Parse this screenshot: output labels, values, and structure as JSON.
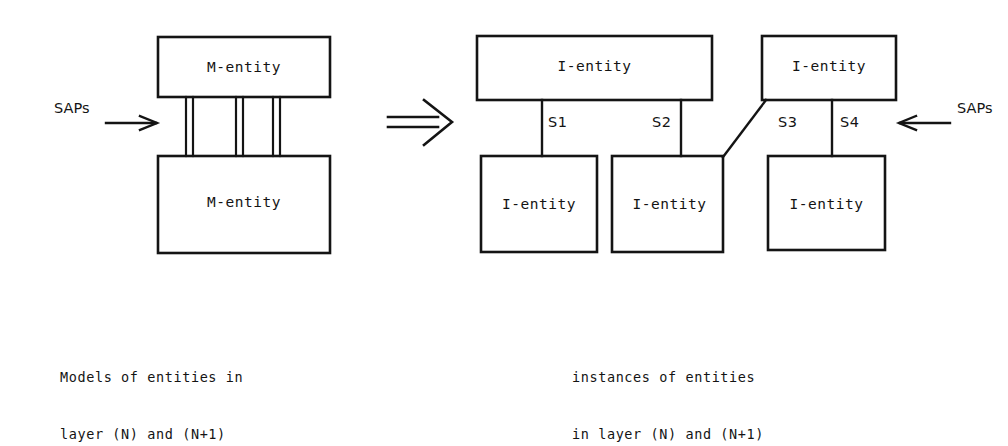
{
  "figure": {
    "stroke_color": "#141414",
    "background_color": "#ffffff"
  },
  "left_panel": {
    "sap_label": "SAPs",
    "arrow_icon": "arrow-right-icon",
    "boxes": [
      {
        "id": "m-entity-upper",
        "label": "M-entity"
      },
      {
        "id": "m-entity-lower",
        "label": "M-entity"
      }
    ],
    "connector_count": 3,
    "connector_note": "three pairs of parallel vertical lines joining the two M-entity boxes",
    "caption": {
      "line1": "Models of entities in",
      "line2": "layer (N) and (N+1)"
    }
  },
  "transform": {
    "symbol": "⇒",
    "icon": "double-arrow-right-icon"
  },
  "right_panel": {
    "sap_label": "SAPs",
    "arrow_icon": "arrow-left-icon",
    "top_boxes": [
      {
        "id": "i-entity-top-wide",
        "label": "I-entity"
      },
      {
        "id": "i-entity-top-right",
        "label": "I-entity"
      }
    ],
    "bottom_boxes": [
      {
        "id": "i-entity-bottom-1",
        "label": "I-entity"
      },
      {
        "id": "i-entity-bottom-2",
        "label": "I-entity"
      },
      {
        "id": "i-entity-bottom-3",
        "label": "I-entity"
      }
    ],
    "connections": [
      {
        "id": "s1",
        "label": "S1",
        "kind": "vertical",
        "from": "i-entity-top-wide",
        "to": "i-entity-bottom-1"
      },
      {
        "id": "s2",
        "label": "S2",
        "kind": "vertical",
        "from": "i-entity-top-wide",
        "to": "i-entity-bottom-2"
      },
      {
        "id": "s3",
        "label": "S3",
        "kind": "diagonal",
        "from": "i-entity-top-right",
        "to": "i-entity-bottom-2"
      },
      {
        "id": "s4",
        "label": "S4",
        "kind": "vertical",
        "from": "i-entity-top-right",
        "to": "i-entity-bottom-3"
      }
    ],
    "caption": {
      "line1": "instances of entities",
      "line2": "in layer (N) and (N+1)"
    }
  }
}
